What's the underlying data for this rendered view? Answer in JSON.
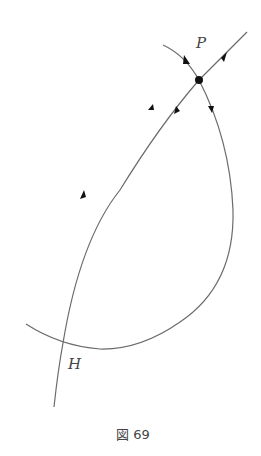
{
  "figure": {
    "caption": "図 69",
    "labels": {
      "P": "P",
      "H": "H"
    },
    "colors": {
      "stroke": "#6b6b6b",
      "node": "#111111",
      "text": "#444444"
    }
  }
}
